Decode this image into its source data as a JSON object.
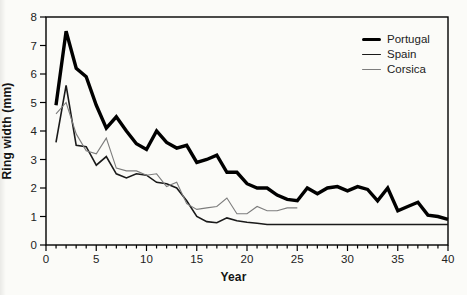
{
  "chart_data": {
    "type": "line",
    "title": "",
    "xlabel": "Year",
    "ylabel": "Ring width (mm)",
    "xlim": [
      0,
      40
    ],
    "ylim": [
      0,
      8
    ],
    "x_major_ticks": [
      0,
      5,
      10,
      15,
      20,
      25,
      30,
      35,
      40
    ],
    "x_minor_tick_interval": 1,
    "y_ticks": [
      0,
      1,
      2,
      3,
      4,
      5,
      6,
      7,
      8
    ],
    "grid": false,
    "frame": "full-box",
    "legend_position": "top-right-inside",
    "axis_color": "#000000",
    "series": [
      {
        "name": "Portugal",
        "color": "#000000",
        "line_width": 3.4,
        "start_year": 1,
        "values": [
          4.9,
          7.5,
          6.2,
          5.9,
          4.9,
          4.1,
          4.5,
          4.0,
          3.55,
          3.35,
          4.0,
          3.6,
          3.4,
          3.5,
          2.9,
          3.0,
          3.15,
          2.55,
          2.55,
          2.15,
          2.0,
          2.0,
          1.75,
          1.6,
          1.55,
          2.0,
          1.8,
          2.0,
          2.05,
          1.9,
          2.05,
          1.95,
          1.55,
          2.0,
          1.2,
          1.35,
          1.5,
          1.05,
          1.0,
          0.9
        ]
      },
      {
        "name": "Spain",
        "color": "#1a1a1a",
        "line_width": 1.6,
        "start_year": 1,
        "values": [
          3.6,
          5.6,
          3.5,
          3.45,
          2.8,
          3.1,
          2.5,
          2.35,
          2.5,
          2.45,
          2.2,
          2.15,
          2.0,
          1.55,
          1.0,
          0.82,
          0.78,
          0.95,
          0.85,
          0.8,
          0.76,
          0.72,
          0.72,
          0.72,
          0.72,
          0.72,
          0.72,
          0.72,
          0.72,
          0.72,
          0.72,
          0.72,
          0.72,
          0.72,
          0.72,
          0.72,
          0.72,
          0.72,
          0.72,
          0.72
        ]
      },
      {
        "name": "Corsica",
        "color": "#7d7d7d",
        "line_width": 1.1,
        "start_year": 1,
        "values": [
          4.6,
          5.0,
          3.9,
          3.3,
          3.2,
          3.75,
          2.7,
          2.6,
          2.6,
          2.45,
          2.5,
          2.05,
          2.2,
          1.45,
          1.25,
          1.3,
          1.35,
          1.65,
          1.1,
          1.1,
          1.35,
          1.2,
          1.2,
          1.3,
          1.3
        ]
      }
    ]
  },
  "colors": {
    "background": "#fbfbf8",
    "text": "#1a1a1a",
    "tick_label": "#222222"
  }
}
